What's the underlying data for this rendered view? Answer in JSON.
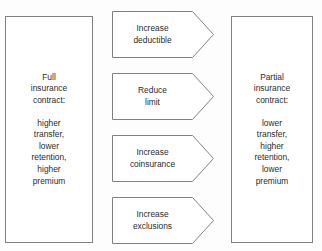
{
  "diagram": {
    "background_color": "#fdfdfd",
    "stroke_color": "#808080",
    "text_color": "#2b2b2b"
  },
  "left_box": {
    "name": "full-insurance-contract",
    "heading_lines": [
      "Full",
      "insurance",
      "contract:"
    ],
    "detail_lines": [
      "higher",
      "transfer,",
      "lower",
      "retention,",
      "higher",
      "premium"
    ]
  },
  "right_box": {
    "name": "partial-insurance-contract",
    "heading_lines": [
      "Partial",
      "insurance",
      "contract:"
    ],
    "detail_lines": [
      "lower",
      "transfer,",
      "higher",
      "retention,",
      "lower",
      "premium"
    ]
  },
  "arrows": [
    {
      "id": "increase-deductible",
      "line1": "Increase",
      "line2": "deductible"
    },
    {
      "id": "reduce-limit",
      "line1": "Reduce",
      "line2": "limit"
    },
    {
      "id": "increase-coinsurance",
      "line1": "Increase",
      "line2": "coinsurance"
    },
    {
      "id": "increase-exclusions",
      "line1": "Increase",
      "line2": "exclusions"
    }
  ]
}
